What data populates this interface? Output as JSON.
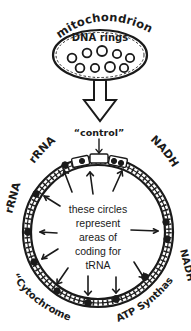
{
  "diagram": {
    "title_top": "mitochondrion",
    "organelle": {
      "label": "mitochondrion",
      "inner_label": "DNA rings",
      "ring_count": 9
    },
    "flow_arrow": {
      "name": "down-arrow",
      "direction": "down"
    },
    "genome": {
      "labels": {
        "control": "“control”",
        "rrna_upper_left": "rRNA",
        "rrna_left": "rRNA",
        "nadh_upper_right": "NADH",
        "nadh_right": "NADH",
        "cytochrome_oxidase": "“Cytochrome oxidase”",
        "atp_synthase": "ATP Synthase"
      },
      "center_note": {
        "line1": "these circles",
        "line2": "represent",
        "line3": "areas of",
        "line4": "coding for",
        "line5": "tRNA"
      },
      "trna_dot_count": 12,
      "callout_arrow_count": 12
    }
  },
  "colors": {
    "ink": "#1a1a1a",
    "paper": "#ffffff"
  }
}
